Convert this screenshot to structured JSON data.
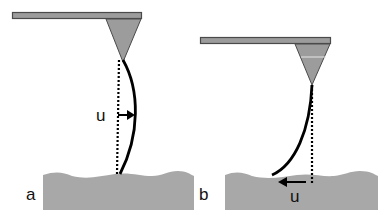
{
  "figure": {
    "panels": [
      {
        "id": "a",
        "label": "a",
        "displacement_label": "u",
        "description": "Cantilever with tip; bent fiber bulging right relative to dotted vertical reference, displacement arrow pointing right"
      },
      {
        "id": "b",
        "label": "b",
        "displacement_label": "u",
        "description": "Cantilever with tip; fiber bent to the left contacting surface, displacement arrow pointing left along surface"
      }
    ],
    "colors": {
      "cantilever_fill": "#9c9c9c",
      "cantilever_stroke": "#4a4a4a",
      "surface_fill": "#a8a8a8",
      "fiber": "#000000",
      "text": "#111111"
    }
  }
}
